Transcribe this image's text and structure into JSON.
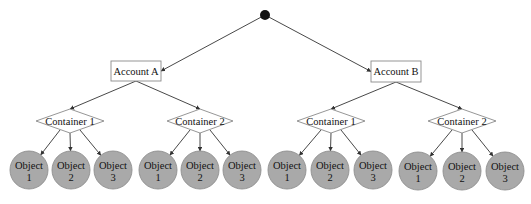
{
  "diagram": {
    "type": "hierarchy-tree",
    "root": {
      "shape": "filled-circle",
      "cx": 265,
      "cy": 15,
      "r": 5,
      "color": "#111111"
    },
    "colors": {
      "edge": "#333333",
      "object_fill": "#a9a9a9",
      "border": "#8a8a8a"
    },
    "accounts": [
      {
        "label": "Account A",
        "box": {
          "x": 111,
          "y": 61,
          "w": 50,
          "h": 20
        },
        "containers": [
          {
            "label": "Container 1",
            "cx": 70,
            "cy": 121,
            "hw": 34,
            "hh": 12,
            "objects": [
              {
                "line1": "Object",
                "line2": "1",
                "cx": 29,
                "cy": 170
              },
              {
                "line1": "Object",
                "line2": "2",
                "cx": 71,
                "cy": 170
              },
              {
                "line1": "Object",
                "line2": "3",
                "cx": 113,
                "cy": 170
              }
            ]
          },
          {
            "label": "Container 2",
            "cx": 200,
            "cy": 121,
            "hw": 33,
            "hh": 12,
            "objects": [
              {
                "line1": "Object",
                "line2": "1",
                "cx": 158,
                "cy": 170
              },
              {
                "line1": "Object",
                "line2": "2",
                "cx": 200,
                "cy": 170
              },
              {
                "line1": "Object",
                "line2": "3",
                "cx": 242,
                "cy": 170
              }
            ]
          }
        ]
      },
      {
        "label": "Account B",
        "box": {
          "x": 371,
          "y": 61,
          "w": 50,
          "h": 21
        },
        "containers": [
          {
            "label": "Container 1",
            "cx": 331,
            "cy": 121,
            "hw": 34,
            "hh": 12,
            "objects": [
              {
                "line1": "Object",
                "line2": "1",
                "cx": 287,
                "cy": 170
              },
              {
                "line1": "Object",
                "line2": "2",
                "cx": 330,
                "cy": 170
              },
              {
                "line1": "Object",
                "line2": "3",
                "cx": 373,
                "cy": 170
              }
            ]
          },
          {
            "label": "Container 2",
            "cx": 462,
            "cy": 121,
            "hw": 34,
            "hh": 12,
            "objects": [
              {
                "line1": "Object",
                "line2": "1",
                "cx": 418,
                "cy": 171
              },
              {
                "line1": "Object",
                "line2": "2",
                "cx": 462,
                "cy": 171
              },
              {
                "line1": "Object",
                "line2": "3",
                "cx": 505,
                "cy": 171
              }
            ]
          }
        ]
      }
    ],
    "object_radius": 19
  }
}
